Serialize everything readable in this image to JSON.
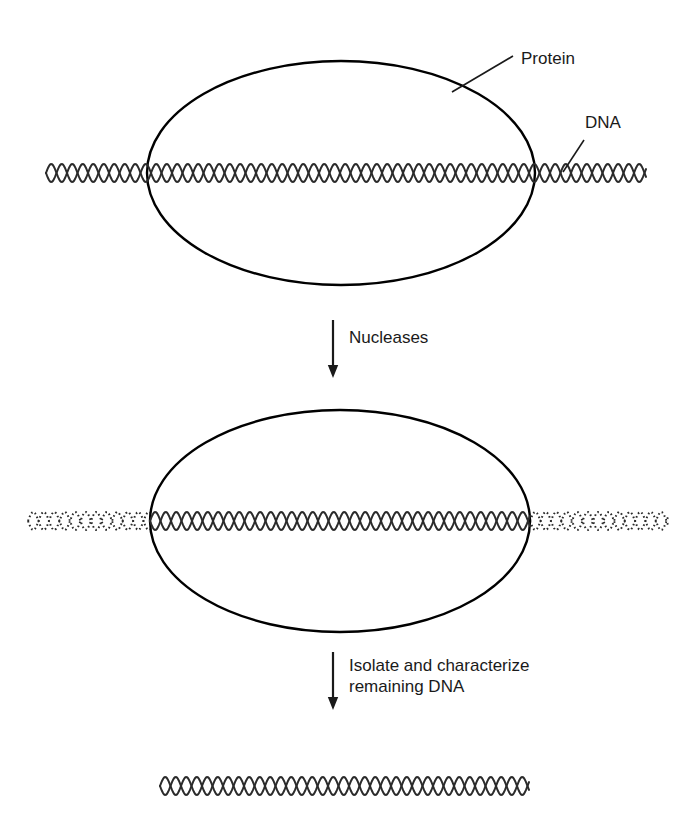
{
  "figure": {
    "background_color": "#ffffff",
    "ink_color": "#1a1a1a",
    "width": 698,
    "height": 832
  },
  "labels": {
    "protein": "Protein",
    "dna": "DNA",
    "step1": "Nucleases",
    "step2_line1": "Isolate and characterize",
    "step2_line2": "remaining DNA"
  },
  "panels": [
    {
      "name": "panel-bound-complex",
      "description": "Protein bound to continuous DNA duplex",
      "ellipse": {
        "cx": 341,
        "cy": 173,
        "rx": 194,
        "ry": 112
      },
      "dna": {
        "y": 173,
        "x_start": 46,
        "x_end": 646,
        "style": "solid",
        "amplitude": 9,
        "period": 21
      }
    },
    {
      "name": "panel-digested-complex",
      "description": "After nuclease digestion, flanking DNA degraded, bound region protected",
      "ellipse": {
        "cx": 340,
        "cy": 521,
        "rx": 190,
        "ry": 111
      },
      "segments": [
        {
          "name": "left-degraded",
          "x_start": 28,
          "x_end": 150,
          "style": "dotted"
        },
        {
          "name": "protected-core",
          "x_start": 150,
          "x_end": 530,
          "style": "solid"
        },
        {
          "name": "right-degraded",
          "x_start": 530,
          "x_end": 668,
          "style": "dotted"
        }
      ],
      "dna": {
        "y": 521,
        "amplitude": 9,
        "period": 21
      }
    },
    {
      "name": "panel-isolated-fragment",
      "description": "Recovered protected DNA fragment",
      "dna": {
        "y": 786,
        "x_start": 160,
        "x_end": 529,
        "style": "solid",
        "amplitude": 9,
        "period": 21
      }
    }
  ],
  "arrows": [
    {
      "name": "arrow-nucleases",
      "x": 333,
      "y_start": 320,
      "y_end": 378,
      "label_key": "step1"
    },
    {
      "name": "arrow-isolate",
      "x": 333,
      "y_start": 652,
      "y_end": 710,
      "label_key": "step2_line1"
    }
  ],
  "leaders": [
    {
      "name": "leader-protein",
      "from_x": 452,
      "from_y": 92,
      "to_x": 513,
      "to_y": 56
    },
    {
      "name": "leader-dna",
      "from_x": 563,
      "from_y": 172,
      "to_x": 584,
      "to_y": 140
    }
  ],
  "colors": {
    "stroke": "#000000",
    "text": "#1a1a1a",
    "helix": "#2b2b2b",
    "background": "#ffffff"
  }
}
